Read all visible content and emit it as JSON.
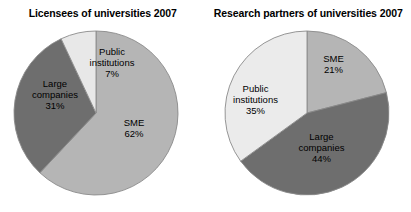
{
  "figure": {
    "background": "#ffffff",
    "width": 411,
    "height": 212
  },
  "palette": {
    "sme": "#b5b5b5",
    "large_companies": "#6e6e6e",
    "public_institutions": "#ebebeb",
    "outline": "#8a8a8a",
    "text": "#000000"
  },
  "charts": [
    {
      "title": "Licensees of universities 2007",
      "slices": [
        {
          "name": "SME",
          "label_line1": "SME",
          "label_line2": "",
          "value_label": "62%",
          "value": 62,
          "color": "#b5b5b5"
        },
        {
          "name": "Large companies",
          "label_line1": "Large",
          "label_line2": "companies",
          "value_label": "31%",
          "value": 31,
          "color": "#6e6e6e"
        },
        {
          "name": "Public institutions",
          "label_line1": "Public",
          "label_line2": "institutions",
          "value_label": "7%",
          "value": 7,
          "color": "#e8e8e8"
        }
      ]
    },
    {
      "title": "Research partners of universities 2007",
      "slices": [
        {
          "name": "SME",
          "label_line1": "SME",
          "label_line2": "",
          "value_label": "21%",
          "value": 21,
          "color": "#b5b5b5"
        },
        {
          "name": "Large companies",
          "label_line1": "Large",
          "label_line2": "companies",
          "value_label": "44%",
          "value": 44,
          "color": "#6e6e6e"
        },
        {
          "name": "Public institutions",
          "label_line1": "Public",
          "label_line2": "institutions",
          "value_label": "35%",
          "value": 35,
          "color": "#ebebeb"
        }
      ]
    }
  ],
  "chart_data": [
    {
      "type": "pie",
      "title": "Licensees of universities 2007",
      "categories": [
        "SME",
        "Large companies",
        "Public institutions"
      ],
      "values": [
        62,
        31,
        7
      ],
      "value_labels": [
        "62%",
        "31%",
        "7%"
      ],
      "unit": "percent",
      "start_angle_deg": 0,
      "direction": "clockwise",
      "colors": [
        "#b5b5b5",
        "#6e6e6e",
        "#e8e8e8"
      ],
      "legend": "none",
      "labels_inside_slices": true,
      "xlabel": "",
      "ylabel": ""
    },
    {
      "type": "pie",
      "title": "Research partners of universities 2007",
      "categories": [
        "SME",
        "Large companies",
        "Public institutions"
      ],
      "values": [
        21,
        44,
        35
      ],
      "value_labels": [
        "21%",
        "44%",
        "35%"
      ],
      "unit": "percent",
      "start_angle_deg": 0,
      "direction": "clockwise",
      "colors": [
        "#b5b5b5",
        "#6e6e6e",
        "#ebebeb"
      ],
      "legend": "none",
      "labels_inside_slices": true,
      "xlabel": "",
      "ylabel": ""
    }
  ]
}
